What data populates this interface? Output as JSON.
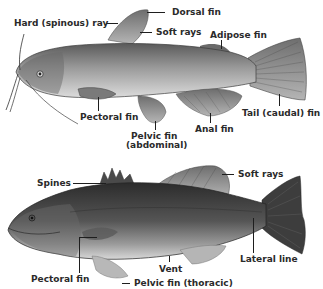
{
  "diagram": {
    "type": "fish-anatomy",
    "figures": [
      {
        "name": "catfish",
        "labels": {
          "hard_ray": "Hard (spinous) ray",
          "dorsal": "Dorsal fin",
          "soft_rays": "Soft rays",
          "adipose": "Adipose fin",
          "pectoral": "Pectoral fin",
          "pelvic_line1": "Pelvic fin",
          "pelvic_line2": "(abdominal)",
          "anal": "Anal fin",
          "tail": "Tail (caudal) fin"
        }
      },
      {
        "name": "bass",
        "labels": {
          "spines": "Spines",
          "soft_rays": "Soft rays",
          "lateral_line": "Lateral line",
          "vent": "Vent",
          "pectoral": "Pectoral fin",
          "pelvic": "Pelvic fin (thoracic)"
        }
      }
    ]
  }
}
